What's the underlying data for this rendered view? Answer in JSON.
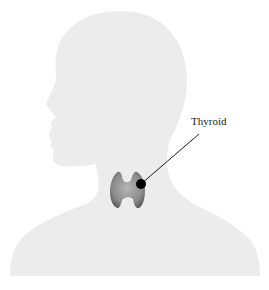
{
  "diagram": {
    "organ": "thyroid gland",
    "labels": [
      {
        "text": "Thyroid",
        "points_to": "thyroid-marker"
      }
    ],
    "colors": {
      "background": "#ffffff",
      "silhouette": "#ececec",
      "thyroid": "#8a8a8a",
      "marker": "#000000",
      "leader_line": "#1a1a1a"
    }
  }
}
